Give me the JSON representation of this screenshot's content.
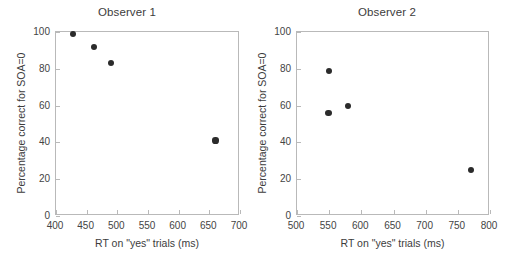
{
  "chart_data": [
    {
      "type": "scatter",
      "title": "Observer 1",
      "xlabel": "RT on \"yes\" trials (ms)",
      "ylabel": "Percentage correct for SOA=0",
      "xlim": [
        400,
        700
      ],
      "ylim": [
        0,
        100
      ],
      "xticks": [
        400,
        450,
        500,
        550,
        600,
        650,
        700
      ],
      "xticklabels": [
        "400",
        "450",
        "500",
        "550",
        "600",
        "650",
        "700"
      ],
      "yticks": [
        0,
        20,
        40,
        60,
        80,
        100
      ],
      "yticklabels": [
        "0",
        "20",
        "40",
        "60",
        "80",
        "100"
      ],
      "grid": false,
      "legend": false,
      "marker": "filled-circle",
      "marker_color": "#2b2b2b",
      "points": [
        {
          "x": 428,
          "y": 99
        },
        {
          "x": 462,
          "y": 92
        },
        {
          "x": 490,
          "y": 83
        },
        {
          "x": 660,
          "y": 41
        }
      ]
    },
    {
      "type": "scatter",
      "title": "Observer 2",
      "xlabel": "RT on \"yes\" trials (ms)",
      "ylabel": "Percentage correct for SOA=0",
      "xlim": [
        500,
        800
      ],
      "ylim": [
        0,
        100
      ],
      "xticks": [
        500,
        550,
        600,
        650,
        700,
        750,
        800
      ],
      "xticklabels": [
        "500",
        "550",
        "600",
        "650",
        "700",
        "750",
        "800"
      ],
      "yticks": [
        0,
        20,
        40,
        60,
        80,
        100
      ],
      "yticklabels": [
        "0",
        "20",
        "40",
        "60",
        "80",
        "100"
      ],
      "grid": false,
      "legend": false,
      "marker": "filled-circle",
      "marker_color": "#2b2b2b",
      "points": [
        {
          "x": 550,
          "y": 79
        },
        {
          "x": 549,
          "y": 56
        },
        {
          "x": 579,
          "y": 60
        },
        {
          "x": 771,
          "y": 25
        }
      ]
    }
  ],
  "figure": {
    "background": "#ffffff",
    "axis_color": "#b9b9b9",
    "text_color": "#3c3c3c"
  }
}
